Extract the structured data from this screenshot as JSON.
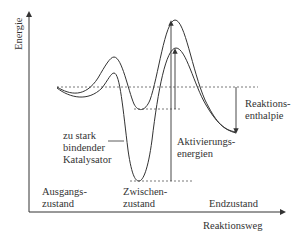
{
  "diagram": {
    "type": "energy_profile",
    "axes": {
      "y_label": "Energie",
      "x_label": "Reaktionsweg"
    },
    "states": {
      "start": [
        "Ausgangs-",
        "zustand"
      ],
      "intermediate": [
        "Zwischen-",
        "zustand"
      ],
      "end": "Endzustand"
    },
    "annotations": {
      "catalyst": [
        "zu stark",
        "bindender",
        "Katalysator"
      ],
      "activation": [
        "Aktivierungs-",
        "energien"
      ],
      "enthalpy": [
        "Reaktions-",
        "enthalpie"
      ]
    },
    "colors": {
      "line": "#333333",
      "dashed": "#555555",
      "background": "#ffffff"
    }
  }
}
